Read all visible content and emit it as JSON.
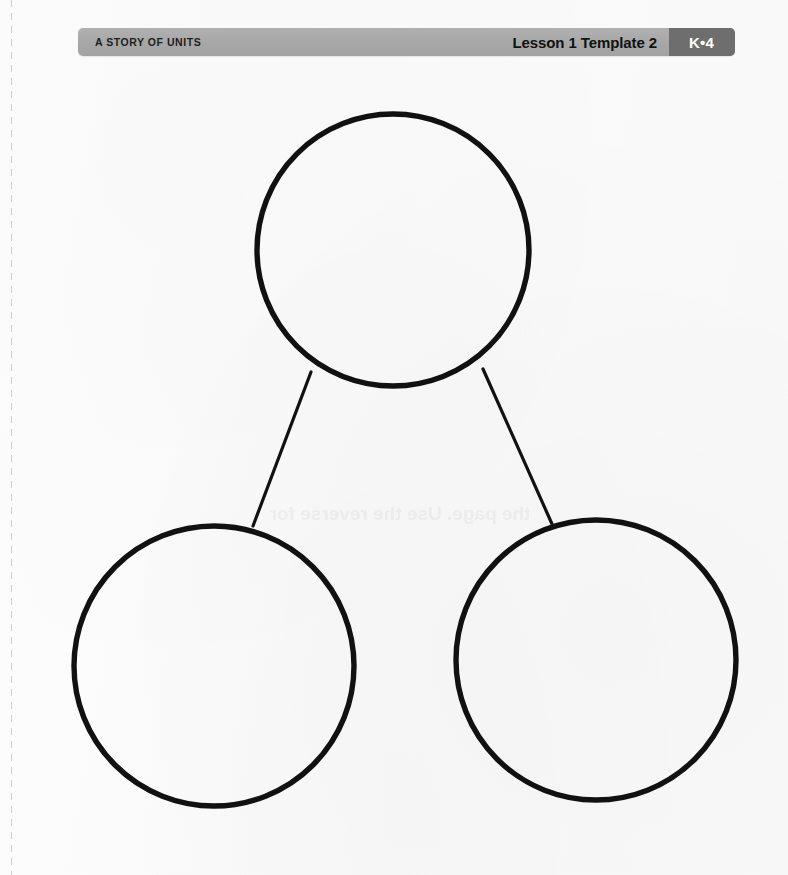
{
  "page": {
    "background_color": "#fbfbfb",
    "width": 788,
    "height": 875
  },
  "header": {
    "series_title": "A STORY OF UNITS",
    "lesson_label": "Lesson 1 Template 2",
    "grade_badge": "K•4",
    "bar_color": "#a7a7a7",
    "badge_color": "#6e6e6e",
    "badge_text_color": "#ffffff",
    "text_color": "#1d1d1d"
  },
  "perforation": {
    "name": "cut-line",
    "color": "#787878"
  },
  "bleed_through": {
    "text": "the page. Use the reverse for",
    "color": "#5a5a5f"
  },
  "number_bond": {
    "stroke_color": "#111111",
    "circle_stroke_width": 5,
    "line_stroke_width": 3,
    "circles": [
      {
        "name": "whole-circle",
        "label": "",
        "cx": 393,
        "cy": 250,
        "r": 136
      },
      {
        "name": "part-circle-left",
        "label": "",
        "cx": 214,
        "cy": 666,
        "r": 140
      },
      {
        "name": "part-circle-right",
        "label": "",
        "cx": 596,
        "cy": 660,
        "r": 140
      }
    ],
    "connectors": [
      {
        "name": "connector-left",
        "x1": 311,
        "y1": 372,
        "x2": 253,
        "y2": 526
      },
      {
        "name": "connector-right",
        "x1": 483,
        "y1": 369,
        "x2": 552,
        "y2": 524
      }
    ]
  }
}
